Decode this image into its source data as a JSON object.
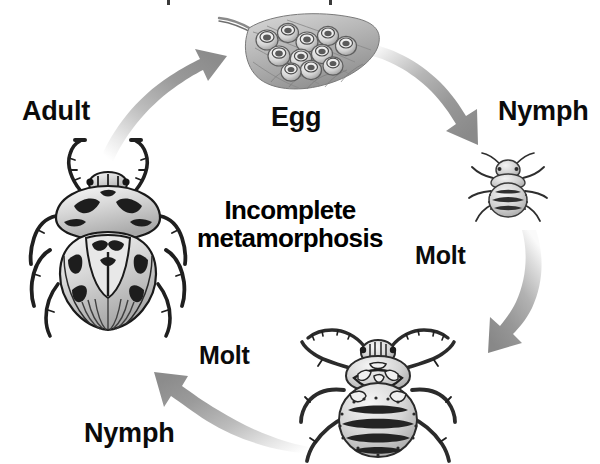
{
  "diagram": {
    "title_line1": "Incomplete",
    "title_line2": "metamorphosis",
    "type": "insect life cycle diagram",
    "background_color": "#ffffff",
    "text_color": "#0b0b0b",
    "arrow_color_dark": "#8e8e8e",
    "arrow_color_light": "#f2f2f2"
  },
  "labels": {
    "adult": "Adult",
    "egg": "Egg",
    "nymph_right": "Nymph",
    "nymph_bottom": "Nymph",
    "molt_right": "Molt",
    "molt_left": "Molt"
  },
  "illustrations": {
    "egg_mass": "egg-mass-on-leaf-illustration",
    "nymph_early": "early-instar-nymph-illustration",
    "nymph_late": "late-instar-nymph-illustration",
    "adult_bug": "adult-stink-bug-illustration"
  },
  "arrows": {
    "adult_to_egg": "curved-arrow-up-right",
    "egg_to_nymph": "curved-arrow-down-right",
    "nymph_to_nymph": "curved-arrow-down",
    "nymph_to_adult": "curved-arrow-up-left"
  }
}
